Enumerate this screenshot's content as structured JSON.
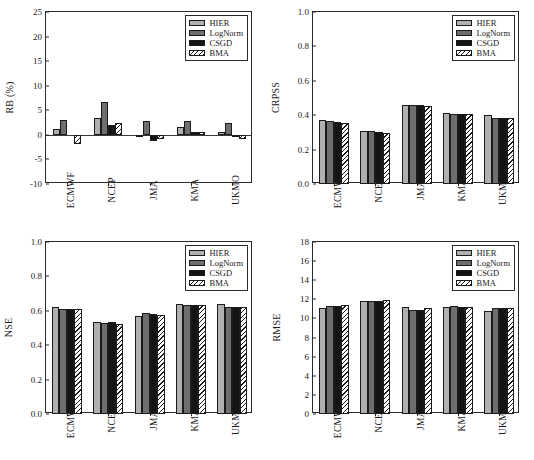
{
  "figure": {
    "title": "",
    "series_names": [
      "HIER",
      "LogNorm",
      "CSGD",
      "BMA"
    ],
    "series_colors": {
      "HIER": "#b0b0b0",
      "LogNorm": "#6e6e6e",
      "CSGD": "#141414",
      "BMA": "#ffffff"
    },
    "categories": [
      "ECMWF",
      "NCEP",
      "JMA",
      "KMA",
      "UKMO"
    ]
  },
  "legend": {
    "items": [
      {
        "label": "HIER",
        "style": "solid-light-gray"
      },
      {
        "label": "LogNorm",
        "style": "solid-dark-gray"
      },
      {
        "label": "CSGD",
        "style": "solid-black"
      },
      {
        "label": "BMA",
        "style": "diagonal-hatch"
      }
    ]
  },
  "chart_data": [
    {
      "id": "rb",
      "type": "bar",
      "title": "",
      "xlabel": "",
      "ylabel": "RB (%)",
      "categories": [
        "ECMWF",
        "NCEP",
        "JMA",
        "KMA",
        "UKMO"
      ],
      "ylim": [
        -10,
        25
      ],
      "yticks": [
        -10,
        -5,
        0,
        5,
        10,
        15,
        20,
        25
      ],
      "ytick_labels": [
        "-10",
        "-5",
        "0",
        "5",
        "10",
        "15",
        "20",
        "25"
      ],
      "grid": false,
      "legend_position": "top-right",
      "series": [
        {
          "name": "HIER",
          "values": [
            1.1,
            3.4,
            -0.3,
            1.6,
            0.6
          ]
        },
        {
          "name": "LogNorm",
          "values": [
            3.1,
            6.7,
            2.9,
            2.9,
            2.5
          ]
        },
        {
          "name": "CSGD",
          "values": [
            0.0,
            2.0,
            -1.3,
            0.5,
            -0.4
          ]
        },
        {
          "name": "BMA",
          "values": [
            -1.9,
            2.4,
            -0.9,
            0.5,
            -0.8
          ]
        }
      ]
    },
    {
      "id": "crpss",
      "type": "bar",
      "title": "",
      "xlabel": "",
      "ylabel": "CRPSS",
      "categories": [
        "ECMWF",
        "NCEP",
        "JMA",
        "KMA",
        "UKMO"
      ],
      "ylim": [
        0.0,
        1.0
      ],
      "yticks": [
        0.0,
        0.2,
        0.4,
        0.6,
        0.8,
        1.0
      ],
      "ytick_labels": [
        "0.0",
        "0.2",
        "0.4",
        "0.6",
        "0.8",
        "1.0"
      ],
      "grid": false,
      "legend_position": "top-right",
      "series": [
        {
          "name": "HIER",
          "values": [
            0.372,
            0.311,
            0.459,
            0.413,
            0.399
          ]
        },
        {
          "name": "LogNorm",
          "values": [
            0.364,
            0.306,
            0.46,
            0.405,
            0.384
          ]
        },
        {
          "name": "CSGD",
          "values": [
            0.358,
            0.302,
            0.461,
            0.406,
            0.383
          ]
        },
        {
          "name": "BMA",
          "values": [
            0.355,
            0.298,
            0.454,
            0.405,
            0.381
          ]
        }
      ]
    },
    {
      "id": "nse",
      "type": "bar",
      "title": "",
      "xlabel": "",
      "ylabel": "NSE",
      "categories": [
        "ECMWF",
        "NCEP",
        "JMA",
        "KMA",
        "UKMO"
      ],
      "ylim": [
        0.0,
        1.0
      ],
      "yticks": [
        0.0,
        0.2,
        0.4,
        0.6,
        0.8,
        1.0
      ],
      "ytick_labels": [
        "0.0",
        "0.2",
        "0.4",
        "0.6",
        "0.8",
        "1.0"
      ],
      "grid": false,
      "legend_position": "top-right",
      "series": [
        {
          "name": "HIER",
          "values": [
            0.623,
            0.533,
            0.568,
            0.637,
            0.637
          ]
        },
        {
          "name": "LogNorm",
          "values": [
            0.613,
            0.53,
            0.585,
            0.632,
            0.623
          ]
        },
        {
          "name": "CSGD",
          "values": [
            0.61,
            0.532,
            0.583,
            0.634,
            0.621
          ]
        },
        {
          "name": "BMA",
          "values": [
            0.609,
            0.524,
            0.574,
            0.634,
            0.621
          ]
        }
      ]
    },
    {
      "id": "rmse",
      "type": "bar",
      "title": "",
      "xlabel": "",
      "ylabel": "RMSE",
      "categories": [
        "ECMWF",
        "NCEP",
        "JMA",
        "KMA",
        "UKMO"
      ],
      "ylim": [
        0,
        18
      ],
      "yticks": [
        0,
        2,
        4,
        6,
        8,
        10,
        12,
        14,
        16,
        18
      ],
      "ytick_labels": [
        "0",
        "2",
        "4",
        "6",
        "8",
        "10",
        "12",
        "14",
        "16",
        "18"
      ],
      "grid": false,
      "legend_position": "top-right",
      "series": [
        {
          "name": "HIER",
          "values": [
            11.1,
            11.8,
            11.2,
            11.2,
            10.8
          ]
        },
        {
          "name": "LogNorm",
          "values": [
            11.3,
            11.8,
            10.9,
            11.3,
            11.1
          ]
        },
        {
          "name": "CSGD",
          "values": [
            11.3,
            11.8,
            10.9,
            11.2,
            11.1
          ]
        },
        {
          "name": "BMA",
          "values": [
            11.4,
            11.9,
            11.1,
            11.2,
            11.1
          ]
        }
      ]
    }
  ]
}
